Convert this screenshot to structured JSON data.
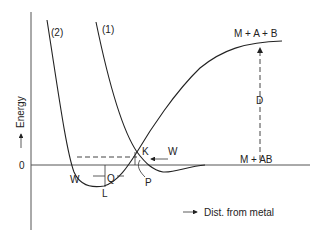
{
  "diagram": {
    "type": "potential-energy-diagram",
    "y_axis": {
      "label": "Energy",
      "zero_label": "0"
    },
    "x_axis": {
      "label": "Dist. from metal"
    },
    "curves": [
      {
        "id": "curve-2",
        "label": "(2)"
      },
      {
        "id": "curve-1",
        "label": "(1)"
      }
    ],
    "states": {
      "dissociated": "M + A + B",
      "molecular": "M + AB"
    },
    "points": {
      "crossing": "K",
      "well_bottom": "L",
      "physisorption": "P",
      "dissociation_energy": "D",
      "heat_left": "W",
      "heat_right": "W",
      "heat_q": "Q"
    }
  }
}
